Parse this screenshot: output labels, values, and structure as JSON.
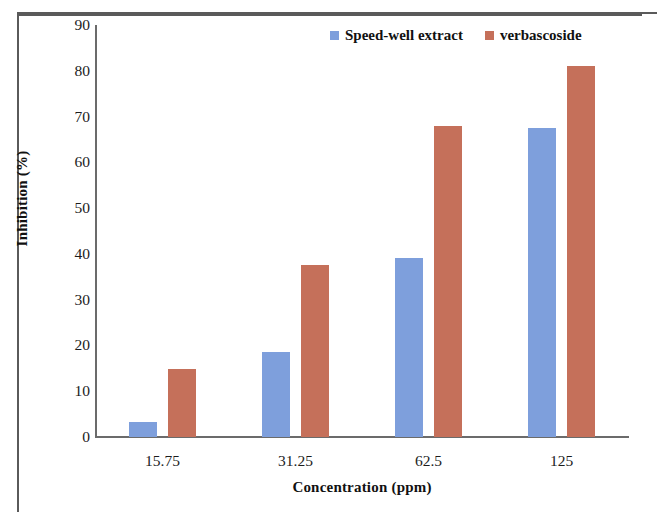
{
  "chart_data": {
    "type": "bar",
    "title": "",
    "xlabel": "Concentration (ppm)",
    "ylabel": "Inhibition (%)",
    "categories": [
      "15.75",
      "31.25",
      "62.5",
      "125"
    ],
    "series": [
      {
        "name": "Speed-well extract",
        "color": "#7e9fdc",
        "values": [
          3.3,
          18.5,
          39.0,
          67.5
        ]
      },
      {
        "name": "verbascoside",
        "color": "#c5705a",
        "values": [
          14.8,
          37.5,
          68.0,
          81.0
        ]
      }
    ],
    "ylim": [
      0,
      90
    ],
    "ytick_step": 10,
    "yticks": [
      "0",
      "10",
      "20",
      "30",
      "40",
      "50",
      "60",
      "70",
      "80",
      "90"
    ],
    "grid": false,
    "legend_position": "top-right"
  },
  "legend": {
    "entries": [
      {
        "label": "Speed-well extract",
        "swatch": "legend-swatch-blue"
      },
      {
        "label": "verbascoside",
        "swatch": "legend-swatch-red"
      }
    ]
  },
  "axes": {
    "x_title": "Concentration (ppm)",
    "y_title": "Inhibition (%)"
  }
}
